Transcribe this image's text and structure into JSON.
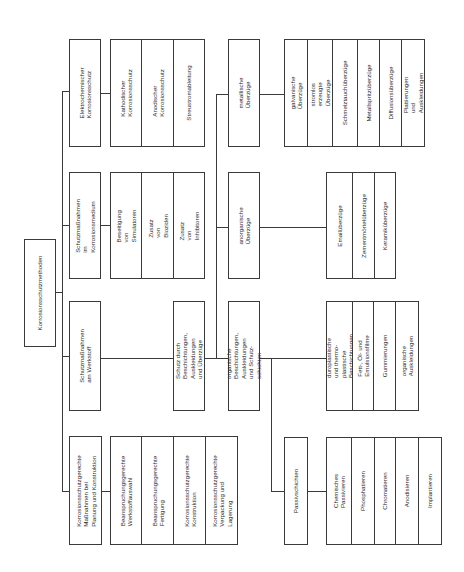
{
  "diagram": {
    "title": "Korrosionsschutzmethoden",
    "categories": [
      {
        "label": "Elektrochemischer\nKorrosionsschutz",
        "children": [
          {
            "label": "Kathodischer\nKorrosionsschutz"
          },
          {
            "label": "Anodischer\nKorrosionsschutz"
          },
          {
            "label": "Streustromableitung"
          }
        ]
      },
      {
        "label": "Schutzmaßnahmen im\nKorrosionsmedium",
        "children": [
          {
            "label": "Beseitigung von\nSimulatoren"
          },
          {
            "label": "Zusatz von Bioziden"
          },
          {
            "label": "Zusatz von Inhibitoren"
          }
        ]
      },
      {
        "label": "Schutzmaßnahmen\nam Werkstoff",
        "children": [
          {
            "label": "Schutz durch Beschichtungen,\nAuskleidungen und Überzüge",
            "children": [
              {
                "label": "metallische Überzüge",
                "children": [
                  {
                    "label": "galvanische Überzüge"
                  },
                  {
                    "label": "stromlos erzeugte\nÜberzüge"
                  },
                  {
                    "label": "Schmelztauchüberzüge"
                  },
                  {
                    "label": "Metallspritzüberzüge"
                  },
                  {
                    "label": "Diffusionsüberzüge"
                  },
                  {
                    "label": "Plattierungen und\nAuskleidungen"
                  }
                ]
              },
              {
                "label": "anorganische Überzüge",
                "children": [
                  {
                    "label": "Emailüberzüge"
                  },
                  {
                    "label": "Zementmörtelüberzüge"
                  },
                  {
                    "label": "Keramiküberzüge"
                  }
                ]
              },
              {
                "label": "organische Beschichtungen,\nAuskleidungen und Schutz-\nschichten",
                "children": [
                  {
                    "label": "duroplastische und thermo-\nplastische Beschichtungen"
                  },
                  {
                    "label": "Fett-, Öl- und Emulsionsfilme"
                  },
                  {
                    "label": "Gummierungen"
                  },
                  {
                    "label": "organische Auskleidungen"
                  }
                ]
              },
              {
                "label": "Passivschichten",
                "children": [
                  {
                    "label": "Chemisches Passivieren"
                  },
                  {
                    "label": "Phosphatieren"
                  },
                  {
                    "label": "Chromatieren"
                  },
                  {
                    "label": "Anodisieren"
                  },
                  {
                    "label": "Implantieren"
                  }
                ]
              }
            ]
          }
        ]
      },
      {
        "label": "Korrosionsschutzgerechte\nMaßnahmen bei\nPlanung und Konstruktion",
        "children": [
          {
            "label": "Beanspruchungsgerechte\nWerkstoffauswahl"
          },
          {
            "label": "Beanspruchungsgerechte\nFertigung"
          },
          {
            "label": "Korrosionsschutzgerechte\nKonstruktion"
          },
          {
            "label": "Korrosionsschutzgerechte\nVerpackung und Lagerung"
          }
        ]
      }
    ]
  }
}
